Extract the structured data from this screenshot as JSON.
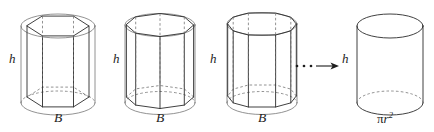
{
  "diagram": {
    "stroke_color": "#2b2b2b",
    "hidden_edge_color": "#6e6e6e",
    "background_color": "#ffffff"
  },
  "figures": [
    {
      "id": "hexagonal-prism",
      "sides": 6,
      "height_label": "h",
      "base_label": "B",
      "center_x": 58,
      "radius_x": 37,
      "radius_y": 12,
      "top_y": 26,
      "bottom_y": 103
    },
    {
      "id": "octagonal-prism",
      "sides": 8,
      "height_label": "h",
      "base_label": "B",
      "center_x": 160,
      "radius_x": 35,
      "radius_y": 11.5,
      "top_y": 25,
      "bottom_y": 103
    },
    {
      "id": "decagonal-prism",
      "sides": 10,
      "height_label": "h",
      "base_label": "B",
      "center_x": 262,
      "radius_x": 35,
      "radius_y": 11.5,
      "top_y": 24,
      "bottom_y": 103
    },
    {
      "id": "limit-cylinder",
      "sides": 0,
      "height_label": "h",
      "base_label": "πr",
      "base_label_exponent": "2",
      "center_x": 390,
      "radius_x": 33,
      "radius_y": 12,
      "top_y": 26,
      "bottom_y": 103
    }
  ],
  "height_labels": [
    {
      "text": "h",
      "x": 11,
      "y": 59
    },
    {
      "text": "h",
      "x": 115,
      "y": 59
    },
    {
      "text": "h",
      "x": 212,
      "y": 59
    },
    {
      "text": "h",
      "x": 342,
      "y": 59
    }
  ],
  "base_labels": [
    {
      "text": "B",
      "x": 54,
      "y": 112
    },
    {
      "text": "B",
      "x": 156,
      "y": 112
    },
    {
      "text": "B",
      "x": 258,
      "y": 112
    }
  ],
  "area_label": {
    "pi_symbol": "π",
    "variable": "r",
    "exponent": "2",
    "x": 377,
    "y": 112
  },
  "ellipsis_arrow": {
    "dots": "•••",
    "dot_count": 3,
    "dot_start_x": 296,
    "dot_spacing": 7,
    "dot_y": 66,
    "dot_radius": 1.3,
    "arrow_start_x": 314,
    "arrow_end_x": 336,
    "arrow_y": 66
  }
}
